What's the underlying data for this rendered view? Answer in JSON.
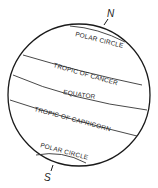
{
  "diagram": {
    "title": "",
    "poles": {
      "north": "N",
      "south": "S"
    },
    "lines": [
      {
        "id": "north-polar-circle",
        "label": "POLAR CIRCLE"
      },
      {
        "id": "tropic-of-cancer",
        "label": "TROPIC OF CANCER"
      },
      {
        "id": "equator",
        "label": "EQUATOR"
      },
      {
        "id": "tropic-of-capricorn",
        "label": "TROPIC OF CAPRICORN"
      },
      {
        "id": "south-polar-circle",
        "label": "POLAR CIRCLE"
      }
    ],
    "colors": {
      "outline": "#1a1a1a",
      "background": "#ffffff"
    }
  }
}
